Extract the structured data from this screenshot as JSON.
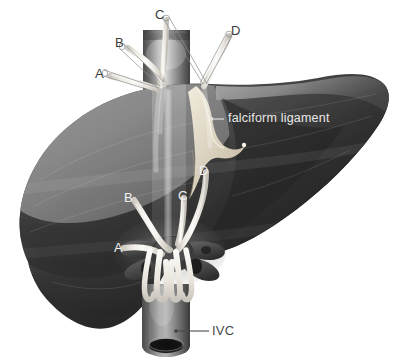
{
  "figure": {
    "view": "anterior-superior",
    "background_color": "#ffffff"
  },
  "palette": {
    "background": "#ffffff",
    "liver_left_lobe_light": "#8d8d8d",
    "liver_left_lobe_mid": "#7a7a7a",
    "liver_lower_mid": "#4b4b4b",
    "liver_right_lobe_dark": "#2f2f2f",
    "liver_right_lobe_darkest": "#232323",
    "liver_rim_highlight": "#a6a6a6",
    "vessel_tube_white": "#f4f2ee",
    "vessel_tube_shadow": "#cfcbc4",
    "ivc_gray": "#8a8a8a",
    "ivc_dark_lumen": "#1c1c1c",
    "falciform_cream": "#ded6c4",
    "leader_line_dark": "#3c3c3c",
    "leader_line_light": "#e8e8e8",
    "label_dark_text": "#3c3c3c",
    "label_light_text": "#f2f2f2"
  },
  "labels": {
    "outer": [
      {
        "id": "outer-c",
        "text": "C",
        "color": "dark",
        "x": 155,
        "y": 9,
        "leader": {
          "from": [
            166,
            19
          ],
          "to": [
            203,
            86
          ]
        }
      },
      {
        "id": "outer-d",
        "text": "D",
        "color": "dark",
        "x": 231,
        "y": 25,
        "leader": {
          "from": [
            229,
            36
          ],
          "to": [
            205,
            86
          ]
        }
      },
      {
        "id": "outer-b",
        "text": "B",
        "color": "dark",
        "x": 117,
        "y": 37,
        "leader": {
          "from": [
            128,
            48
          ],
          "to": [
            168,
            84
          ]
        }
      },
      {
        "id": "outer-a",
        "text": "A",
        "color": "dark",
        "x": 97,
        "y": 69,
        "leader": {
          "from": [
            109,
            76
          ],
          "to": [
            160,
            90
          ]
        }
      }
    ],
    "inner": [
      {
        "id": "inner-d",
        "text": "D",
        "color": "light",
        "x": 200,
        "y": 166
      },
      {
        "id": "inner-b",
        "text": "B",
        "color": "light",
        "x": 126,
        "y": 193
      },
      {
        "id": "inner-c",
        "text": "C",
        "color": "light",
        "x": 180,
        "y": 191
      },
      {
        "id": "inner-a",
        "text": "A",
        "color": "light",
        "x": 116,
        "y": 243
      }
    ],
    "falciform": {
      "id": "falciform-ligament",
      "text": "falciform ligament",
      "color": "light",
      "x": 228,
      "y": 112,
      "leader": {
        "from": [
          226,
          118
        ],
        "to": [
          214,
          119
        ]
      }
    },
    "ivc": {
      "id": "ivc",
      "text": "IVC",
      "color": "dark",
      "x": 213,
      "y": 325,
      "leader": {
        "from": [
          210,
          331
        ],
        "to": [
          176,
          331
        ]
      }
    }
  },
  "structures": [
    {
      "id": "liver-left-lobe",
      "name": "left lobe of liver",
      "shade": "light gray"
    },
    {
      "id": "liver-right-lobe",
      "name": "right lobe of liver",
      "shade": "dark gray"
    },
    {
      "id": "suprahepatic-ivc",
      "name": "suprahepatic inferior vena cava",
      "shade": "gray cylinder"
    },
    {
      "id": "infrahepatic-ivc",
      "name": "inferior vena cava (IVC)",
      "shade": "gray cylinder with dark lumen"
    },
    {
      "id": "falciform-ligament-fin",
      "name": "falciform ligament",
      "shade": "cream fin"
    },
    {
      "id": "hepatic-vein-a",
      "name": "hepatic vein A",
      "shade": "white tube"
    },
    {
      "id": "hepatic-vein-b",
      "name": "hepatic vein B",
      "shade": "white tube"
    },
    {
      "id": "hepatic-vein-c",
      "name": "hepatic vein C",
      "shade": "white tube"
    },
    {
      "id": "hepatic-vein-d",
      "name": "hepatic vein D",
      "shade": "white tube"
    }
  ]
}
